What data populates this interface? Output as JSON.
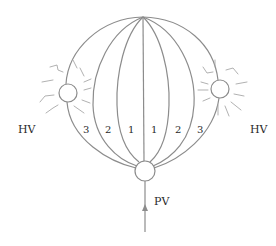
{
  "diagram": {
    "type": "hepatic-lobule-flow-schematic",
    "labels": {
      "hepatic_vein_left": "HV",
      "hepatic_vein_right": "HV",
      "portal_vein": "PV"
    },
    "zones_left": [
      "3",
      "2",
      "1"
    ],
    "zones_right": [
      "1",
      "2",
      "3"
    ],
    "nodes": [
      {
        "id": "portal-vein",
        "label": "PV",
        "position": "bottom"
      },
      {
        "id": "hepatic-vein-left",
        "label": "HV",
        "position": "left"
      },
      {
        "id": "hepatic-vein-right",
        "label": "HV",
        "position": "right"
      }
    ],
    "flow_direction": "upward from PV",
    "colors": {
      "stroke": "#8c8c8c",
      "text": "#2a2a2a",
      "background": "#ffffff"
    }
  }
}
